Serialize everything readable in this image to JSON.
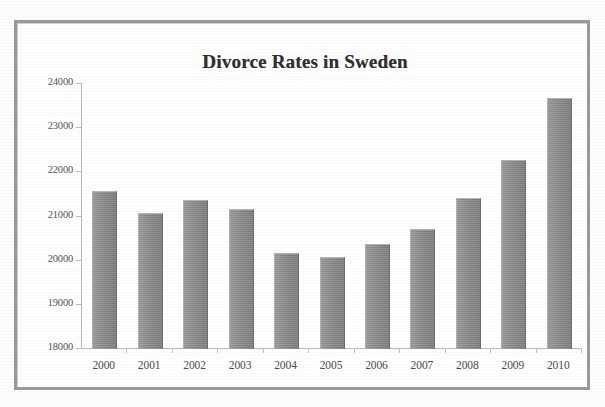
{
  "chart_data": {
    "type": "bar",
    "title": "Divorce Rates in Sweden",
    "xlabel": "",
    "ylabel": "",
    "categories": [
      "2000",
      "2001",
      "2002",
      "2003",
      "2004",
      "2005",
      "2006",
      "2007",
      "2008",
      "2009",
      "2010"
    ],
    "values": [
      21550,
      21050,
      21350,
      21150,
      20150,
      20050,
      20350,
      20700,
      21400,
      22250,
      23650
    ],
    "ylim": [
      18000,
      24000
    ],
    "yticks": [
      18000,
      19000,
      20000,
      21000,
      22000,
      23000,
      24000
    ],
    "ytick_labels": [
      "18000",
      "19000",
      "20000",
      "21000",
      "22000",
      "23000",
      "24000"
    ],
    "grid": false,
    "legend": null,
    "series": [
      {
        "name": "Divorces",
        "values": [
          21550,
          21050,
          21350,
          21150,
          20150,
          20050,
          20350,
          20700,
          21400,
          22250,
          23650
        ]
      }
    ],
    "bar_color": "#8b8b8b",
    "axis_color": "#b9b9b9",
    "title_color": "#2f2f2f",
    "frame_color": "#9a9a9a",
    "background_color": "#ffffff"
  }
}
